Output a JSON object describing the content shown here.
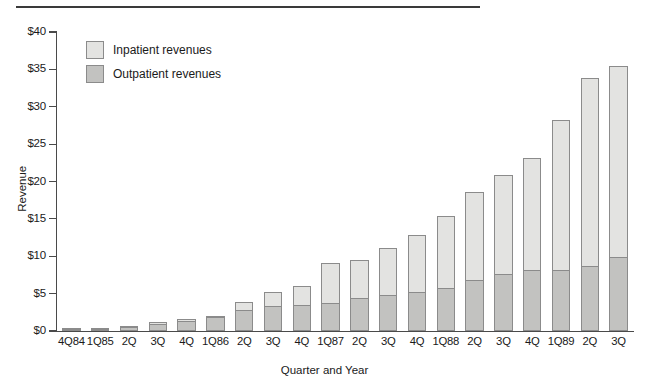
{
  "chart_data": {
    "type": "bar",
    "subtype": "stacked-vertical",
    "title": "",
    "xlabel": "Quarter and Year",
    "ylabel": "Revenue",
    "ylim": [
      0,
      40
    ],
    "ytick_values": [
      0,
      5,
      10,
      15,
      20,
      25,
      30,
      35,
      40
    ],
    "ytick_labels": [
      "$0",
      "$5",
      "$10",
      "$15",
      "$20",
      "$25",
      "$30",
      "$35",
      "$40"
    ],
    "grid": false,
    "legend_position": "upper-left-inside",
    "categories": [
      "4Q84",
      "1Q85",
      "2Q",
      "3Q",
      "4Q",
      "1Q86",
      "2Q",
      "3Q",
      "4Q",
      "1Q87",
      "2Q",
      "3Q",
      "4Q",
      "1Q88",
      "2Q",
      "3Q",
      "4Q",
      "1Q89",
      "2Q",
      "3Q"
    ],
    "series": [
      {
        "name": "Outpatient revenues",
        "color": "#c2c2c0",
        "values": [
          0.1,
          0.1,
          0.5,
          1.0,
          1.4,
          1.9,
          2.8,
          3.3,
          3.5,
          3.7,
          4.4,
          4.8,
          5.2,
          5.8,
          6.8,
          7.6,
          8.1,
          8.2,
          8.7,
          9.9
        ]
      },
      {
        "name": "Inpatient revenues",
        "color": "#e3e3e1",
        "values": [
          0.1,
          0.1,
          0.2,
          0.3,
          0.3,
          0.3,
          1.2,
          2.0,
          2.7,
          5.5,
          5.2,
          6.5,
          7.8,
          9.7,
          11.9,
          13.4,
          15.2,
          20.1,
          25.3,
          25.7
        ]
      }
    ],
    "totals": [
      0.2,
      0.2,
      0.7,
      1.3,
      1.7,
      2.2,
      4.0,
      5.3,
      6.2,
      9.2,
      9.6,
      11.3,
      13.0,
      15.5,
      18.7,
      21.0,
      23.3,
      28.3,
      34.0,
      35.6
    ],
    "legend": [
      {
        "label": "Inpatient revenues",
        "swatch": "inpatient-swatch"
      },
      {
        "label": "Outpatient revenues",
        "swatch": "outpatient-swatch"
      }
    ],
    "colors": {
      "inpatient": "#e3e3e1",
      "outpatient": "#c2c2c0",
      "bar_border": "#8b8b8b",
      "axis": "#4a4a4a",
      "text": "#1a1a1a",
      "rule": "#3a3a3a"
    }
  }
}
